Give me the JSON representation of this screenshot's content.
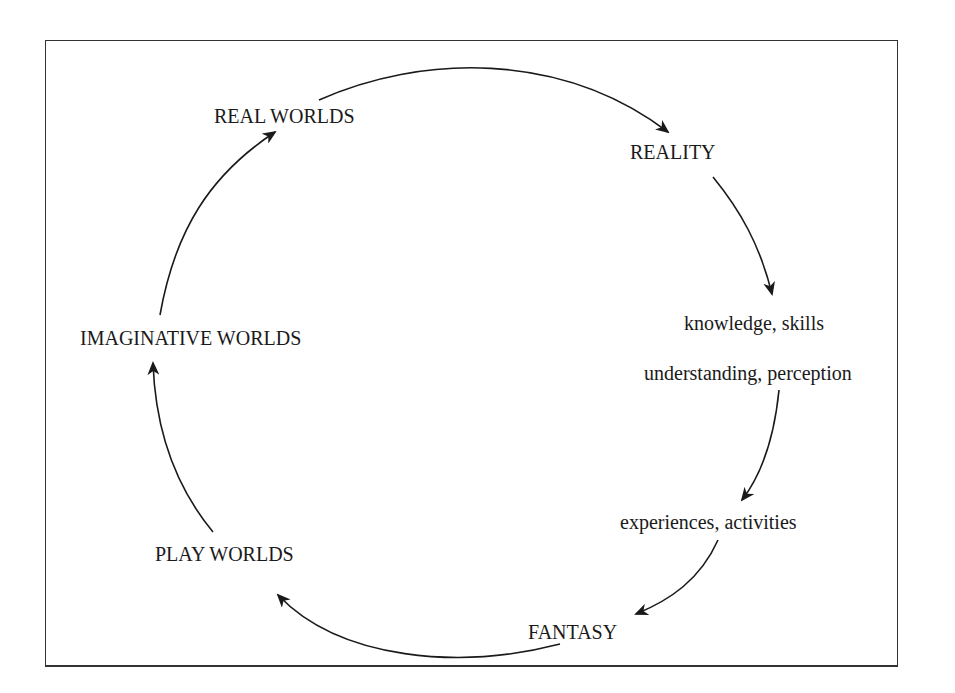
{
  "diagram": {
    "type": "cycle",
    "nodes": {
      "real_worlds": "REAL WORLDS",
      "reality": "REALITY",
      "knowledge_skills": "knowledge, skills",
      "understanding_perception": "understanding, perception",
      "experiences_activities": "experiences, activities",
      "fantasy": "FANTASY",
      "play_worlds": "PLAY WORLDS",
      "imaginative_worlds": "IMAGINATIVE WORLDS"
    },
    "edges": [
      {
        "from": "REAL WORLDS",
        "to": "REALITY"
      },
      {
        "from": "REALITY",
        "to": "knowledge, skills"
      },
      {
        "from": "understanding, perception",
        "to": "experiences, activities"
      },
      {
        "from": "experiences, activities",
        "to": "FANTASY"
      },
      {
        "from": "FANTASY",
        "to": "PLAY WORLDS"
      },
      {
        "from": "PLAY WORLDS",
        "to": "IMAGINATIVE WORLDS"
      },
      {
        "from": "IMAGINATIVE WORLDS",
        "to": "REAL WORLDS"
      }
    ],
    "colors": {
      "stroke": "#1a1a1a",
      "background": "#ffffff"
    }
  }
}
